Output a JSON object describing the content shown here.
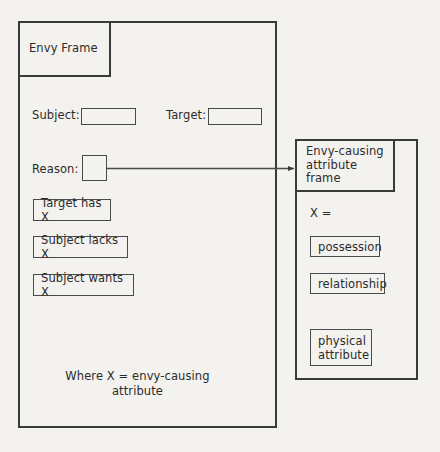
{
  "diagram": {
    "title": "Envy Frame",
    "caption": "Where X = envy-causing\nattribute",
    "envy_frame": {
      "title": "Envy Frame",
      "slots": [
        {
          "label": "Subject:",
          "value": ""
        },
        {
          "label": "Target:",
          "value": ""
        },
        {
          "label": "Reason:",
          "value": ""
        }
      ],
      "conditions": [
        "Target has X",
        "Subject lacks X",
        "Subject wants X"
      ]
    },
    "attribute_frame": {
      "title": "Envy-causing\nattribute\nframe",
      "variable_label": "X =",
      "values": [
        "possession",
        "relationship",
        "physical\nattribute"
      ]
    },
    "connector": {
      "from": "reason-slot-box",
      "to": "attribute-frame",
      "style": "solid-arrow"
    },
    "colors": {
      "background": "#f4f2ee",
      "stroke": "#3a3a3a",
      "thin_stroke": "#4a4a4a",
      "text": "#2b2b2b"
    }
  }
}
